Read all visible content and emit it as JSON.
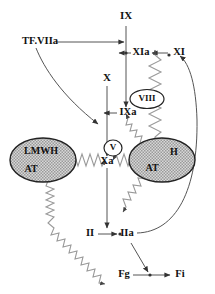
{
  "diagram": {
    "colors": {
      "line": "#555555",
      "text": "#111111",
      "ellipse_fill": "#bdbdbd",
      "ellipse_stroke": "#222222",
      "background": "#ffffff",
      "squiggle": "#999999"
    },
    "nodes": {
      "ix": "IX",
      "ixa": "IXa",
      "xi": "XI",
      "xia": "XIa",
      "x": "X",
      "xa": "Xa",
      "ii": "II",
      "iia": "IIa",
      "fg": "Fg",
      "fi": "Fi",
      "tf_viia": "TF.VIIa",
      "viii": "VIII",
      "v": "V"
    },
    "complexes": {
      "left": {
        "name": "lmwh-at-complex",
        "line1": "LMWH",
        "line2": "AT"
      },
      "right": {
        "name": "heparin-at-complex",
        "line1": "H",
        "line2": "AT"
      }
    },
    "cofactors": {
      "viii": "VIII",
      "v": "V"
    }
  }
}
